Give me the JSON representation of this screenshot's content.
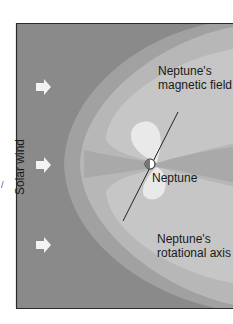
{
  "diagram": {
    "labels": {
      "solar_wind": "Solar wind",
      "magnetic_field": [
        "Neptune's",
        "magnetic field"
      ],
      "planet": "Neptune",
      "rotational_axis": [
        "Neptune's",
        "rotational axis"
      ],
      "stray_mark": "/"
    },
    "arrows": [
      {
        "name": "solar-wind-arrow-top",
        "direction": "right"
      },
      {
        "name": "solar-wind-arrow-middle",
        "direction": "right"
      },
      {
        "name": "solar-wind-arrow-bottom",
        "direction": "right"
      }
    ],
    "colors": {
      "solar_wind_bg": "#8a8a8a",
      "bow_shock_band": "#a3a3a3",
      "magnetosheath": "#b9b9b9",
      "lobes": "#c7c7c7",
      "plasma_sheet": "#a9a9a9",
      "dipole_blobs": "#e9e9e9",
      "arrow": "#f2f2f2",
      "frame": "#2a2a2a",
      "text": "#1a1a1a"
    }
  }
}
